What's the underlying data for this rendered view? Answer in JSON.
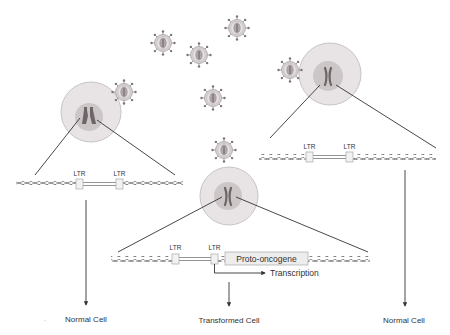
{
  "diagram": {
    "colors": {
      "cell_cytoplasm": "#e8e3e4",
      "cell_border": "#c9c4c5",
      "nucleus": "#cdc6c7",
      "chromosome": "#6e6568",
      "virus_fill": "#d6d1d2",
      "virus_border": "#8c8586",
      "dna_strand": "#8a8a8a",
      "ltr_box": "#f2f2f2",
      "line": "#333333"
    },
    "ltr_label": "LTR",
    "left_panel": {
      "ltr_1": "LTR",
      "ltr_2": "LTR",
      "outcome": "Normal Cell"
    },
    "middle_panel": {
      "ltr_1": "LTR",
      "ltr_2": "LTR",
      "gene_label": "Proto-oncogene",
      "transcription_label": "Transcription",
      "outcome": "Transformed Cell"
    },
    "right_panel": {
      "ltr_1": "LTR",
      "ltr_2": "LTR",
      "outcome": "Normal Cell"
    },
    "free_viruses": 4,
    "bound_viruses": 3
  }
}
